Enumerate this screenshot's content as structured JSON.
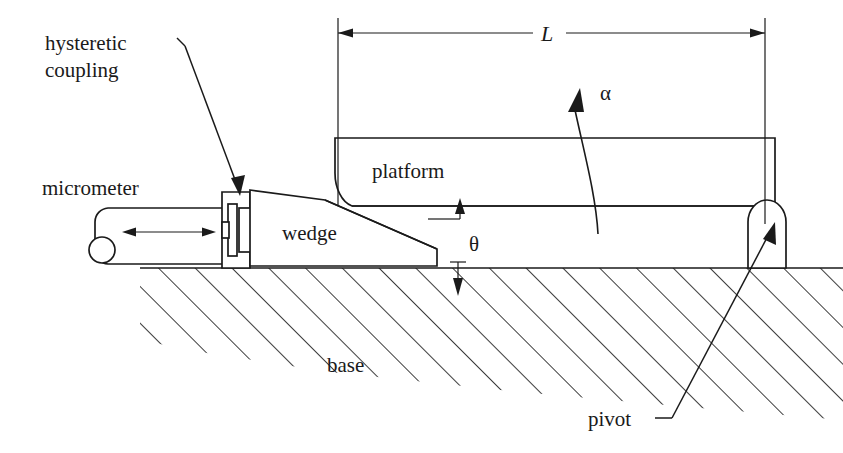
{
  "figure": {
    "kind": "mechanical-schematic",
    "background_color": "#ffffff",
    "line_color": "#1a1a1a"
  },
  "labels": {
    "hysteretic_coupling": "hysteretic\ncoupling",
    "hysteretic_coupling_line1": "hysteretic",
    "hysteretic_coupling_line2": "coupling",
    "micrometer": "micrometer",
    "wedge": "wedge",
    "platform": "platform",
    "base": "base",
    "pivot": "pivot"
  },
  "symbols": {
    "length": "L",
    "alpha": "α",
    "theta": "θ"
  },
  "annotations": {
    "length_dimension": "L",
    "platform_tilt_angle": "α",
    "wedge_angle": "θ",
    "micrometer_travel": "double-headed horizontal arrow"
  },
  "parts": [
    {
      "name": "micrometer",
      "label": "micrometer"
    },
    {
      "name": "hysteretic-coupling",
      "label": "hysteretic coupling"
    },
    {
      "name": "wedge",
      "label": "wedge"
    },
    {
      "name": "platform",
      "label": "platform"
    },
    {
      "name": "pivot",
      "label": "pivot"
    },
    {
      "name": "base",
      "label": "base"
    }
  ]
}
